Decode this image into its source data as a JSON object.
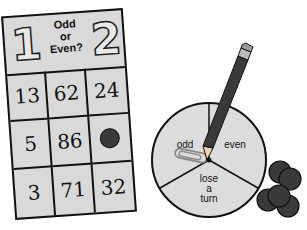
{
  "game_card": {
    "title_line1": "Odd",
    "title_line2": "or",
    "title_line3": "Even?",
    "mascot_left": "1",
    "mascot_right": "2",
    "cells": [
      "13",
      "62",
      "24",
      "5",
      "86",
      "",
      "3",
      "71",
      "32"
    ],
    "covered_cell_index": 5
  },
  "spinner": {
    "sections": [
      "odd",
      "even",
      "lose a turn"
    ],
    "odd_label": "odd",
    "even_label": "even",
    "lose_line1": "lose",
    "lose_line2": "a",
    "lose_line3": "turn"
  },
  "counters": {
    "count": 5,
    "color": "#3a3a3a"
  },
  "colors": {
    "card_fill": "#d9d9d9",
    "outline": "#111111",
    "spinner_fill": "#dcdcdc"
  }
}
